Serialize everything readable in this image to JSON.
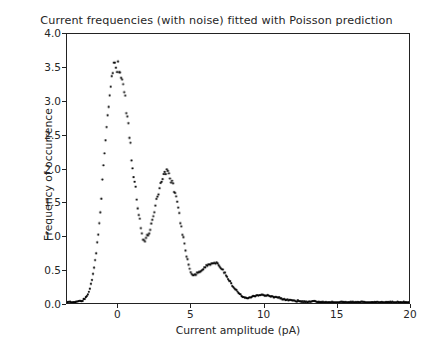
{
  "chart_data": {
    "type": "scatter",
    "title": "Current frequencies (with noise) fitted with Poisson prediction",
    "xlabel": "Current amplitude (pA)",
    "ylabel": "Frequency of occurrence",
    "xlim": [
      -3.5,
      20
    ],
    "ylim": [
      0.0,
      4.0
    ],
    "grid": false,
    "legend": null,
    "marker": "point",
    "marker_color": "#000000",
    "marker_size": 2.2,
    "xticks": [
      0,
      5,
      10,
      15,
      20
    ],
    "xtick_labels": [
      "0",
      "5",
      "10",
      "15",
      "20"
    ],
    "yticks": [
      0.0,
      0.5,
      1.0,
      1.5,
      2.0,
      2.5,
      3.0,
      3.5,
      4.0
    ],
    "ytick_labels": [
      "0.0",
      "0.5",
      "1.0",
      "1.5",
      "2.0",
      "2.5",
      "3.0",
      "3.5",
      "4.0"
    ],
    "peaks": [
      {
        "x": -0.2,
        "y": 3.52
      },
      {
        "x": 3.4,
        "y": 1.95
      },
      {
        "x": 6.8,
        "y": 0.6
      },
      {
        "x": 10.1,
        "y": 0.12
      }
    ],
    "valleys": [
      {
        "x": 1.75,
        "y": 0.93
      },
      {
        "x": 5.1,
        "y": 0.42
      },
      {
        "x": 8.7,
        "y": 0.08
      }
    ],
    "x": [
      -3.5,
      -3.35,
      -3.2,
      -3.05,
      -2.9,
      -2.75,
      -2.6,
      -2.45,
      -2.3,
      -2.15,
      -2.0,
      -1.85,
      -1.7,
      -1.55,
      -1.4,
      -1.25,
      -1.1,
      -0.95,
      -0.8,
      -0.65,
      -0.5,
      -0.35,
      -0.2,
      -0.05,
      0.1,
      0.25,
      0.4,
      0.55,
      0.7,
      0.85,
      1.0,
      1.15,
      1.3,
      1.45,
      1.6,
      1.75,
      1.9,
      2.05,
      2.2,
      2.35,
      2.5,
      2.65,
      2.8,
      2.95,
      3.1,
      3.25,
      3.4,
      3.55,
      3.7,
      3.85,
      4.0,
      4.15,
      4.3,
      4.45,
      4.6,
      4.75,
      4.9,
      5.05,
      5.2,
      5.35,
      5.5,
      5.65,
      5.8,
      5.95,
      6.1,
      6.25,
      6.4,
      6.55,
      6.7,
      6.85,
      7.0,
      7.15,
      7.3,
      7.45,
      7.6,
      7.75,
      7.9,
      8.05,
      8.2,
      8.35,
      8.5,
      8.65,
      8.8,
      8.95,
      9.1,
      9.25,
      9.4,
      9.55,
      9.7,
      9.85,
      10.0,
      10.15,
      10.3,
      10.45,
      10.6,
      10.75,
      10.9,
      11.05,
      11.2,
      11.35,
      11.5,
      11.65,
      11.8,
      11.95,
      12.1,
      12.25,
      12.4,
      12.55,
      12.7,
      12.85,
      13.0,
      13.2,
      13.4,
      13.6,
      13.8,
      14.0,
      14.3,
      14.6,
      14.9,
      15.2,
      15.5,
      15.9,
      16.3,
      16.7,
      17.1,
      17.5,
      17.9,
      18.3,
      18.7,
      19.1,
      19.5,
      19.8,
      20.0
    ],
    "y": [
      0.01,
      0.01,
      0.01,
      0.01,
      0.02,
      0.02,
      0.03,
      0.04,
      0.06,
      0.1,
      0.17,
      0.28,
      0.44,
      0.66,
      0.95,
      1.3,
      1.7,
      2.12,
      2.55,
      2.94,
      3.24,
      3.44,
      3.52,
      3.5,
      3.43,
      3.37,
      3.2,
      2.93,
      2.62,
      2.33,
      2.05,
      1.8,
      1.55,
      1.3,
      1.08,
      0.93,
      0.94,
      1.0,
      1.1,
      1.23,
      1.38,
      1.53,
      1.67,
      1.8,
      1.9,
      1.94,
      1.95,
      1.9,
      1.82,
      1.7,
      1.55,
      1.38,
      1.2,
      1.02,
      0.84,
      0.67,
      0.53,
      0.44,
      0.42,
      0.43,
      0.45,
      0.47,
      0.5,
      0.53,
      0.55,
      0.57,
      0.59,
      0.6,
      0.6,
      0.58,
      0.55,
      0.51,
      0.46,
      0.41,
      0.35,
      0.3,
      0.25,
      0.21,
      0.17,
      0.14,
      0.11,
      0.09,
      0.08,
      0.08,
      0.09,
      0.1,
      0.11,
      0.11,
      0.12,
      0.12,
      0.12,
      0.11,
      0.11,
      0.1,
      0.1,
      0.09,
      0.09,
      0.08,
      0.07,
      0.06,
      0.05,
      0.05,
      0.04,
      0.04,
      0.03,
      0.03,
      0.03,
      0.02,
      0.02,
      0.02,
      0.02,
      0.02,
      0.02,
      0.02,
      0.02,
      0.01,
      0.01,
      0.01,
      0.01,
      0.01,
      0.01,
      0.01,
      0.01,
      0.01,
      0.01,
      0.01,
      0.01,
      0.01,
      0.01,
      0.01,
      0.01,
      0.01,
      0.01
    ]
  }
}
